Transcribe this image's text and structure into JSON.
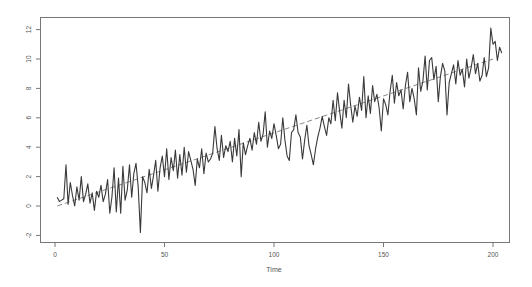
{
  "chart_data": {
    "type": "line",
    "title": "",
    "xlabel": "Time",
    "ylabel": "",
    "xlim": [
      -8,
      209
    ],
    "ylim": [
      -2.4,
      12.8
    ],
    "x_ticks": [
      0,
      50,
      100,
      150,
      200
    ],
    "y_ticks": [
      -2,
      0,
      2,
      4,
      6,
      8,
      10,
      12
    ],
    "grid": false,
    "legend": null,
    "series": [
      {
        "name": "series",
        "style": "solid",
        "color": "#3a3a3a",
        "x_start": 1,
        "values": [
          0.6,
          0.3,
          0.4,
          0.5,
          2.8,
          0.1,
          1.6,
          0.7,
          0.0,
          1.3,
          0.4,
          2.0,
          0.3,
          0.8,
          1.5,
          0.2,
          0.9,
          -0.3,
          1.0,
          0.6,
          1.4,
          0.3,
          0.8,
          1.8,
          -0.5,
          0.6,
          2.6,
          -0.4,
          1.9,
          -0.5,
          2.7,
          0.4,
          1.1,
          2.8,
          0.6,
          2.2,
          2.9,
          1.3,
          -1.8,
          2.0,
          1.6,
          0.9,
          2.5,
          1.2,
          2.1,
          3.1,
          1.0,
          2.6,
          3.4,
          2.0,
          3.9,
          1.8,
          3.3,
          2.4,
          3.8,
          1.9,
          3.5,
          2.1,
          4.0,
          2.3,
          3.7,
          3.1,
          2.5,
          1.4,
          3.2,
          2.6,
          3.9,
          2.2,
          3.6,
          3.0,
          3.2,
          3.6,
          5.4,
          3.9,
          3.1,
          4.8,
          3.3,
          4.1,
          3.7,
          4.4,
          3.0,
          4.6,
          3.4,
          5.2,
          2.0,
          4.3,
          3.5,
          4.1,
          4.6,
          3.8,
          5.0,
          4.2,
          5.7,
          4.4,
          4.9,
          6.4,
          4.0,
          5.1,
          4.6,
          5.6,
          4.8,
          3.9,
          4.2,
          6.0,
          4.5,
          3.4,
          3.1,
          5.0,
          5.2,
          6.2,
          5.0,
          4.7,
          3.2,
          4.5,
          5.5,
          4.1,
          3.5,
          2.8,
          3.9,
          4.7,
          5.3,
          6.1,
          5.4,
          4.8,
          6.0,
          5.6,
          7.2,
          5.8,
          7.7,
          6.4,
          5.3,
          7.2,
          6.0,
          8.3,
          6.9,
          5.7,
          6.8,
          6.1,
          7.4,
          6.5,
          8.8,
          6.0,
          7.5,
          6.3,
          8.2,
          7.1,
          7.6,
          6.7,
          5.1,
          7.3,
          6.9,
          6.2,
          7.8,
          8.9,
          7.0,
          8.4,
          7.5,
          7.9,
          6.6,
          8.2,
          9.1,
          7.1,
          8.0,
          7.3,
          6.2,
          9.4,
          7.8,
          8.5,
          10.2,
          7.9,
          9.9,
          10.1,
          8.6,
          9.5,
          7.1,
          8.8,
          9.7,
          9.2,
          6.2,
          8.4,
          9.0,
          9.6,
          8.3,
          9.9,
          8.9,
          9.3,
          8.1,
          10.0,
          8.7,
          9.4,
          10.3,
          9.0,
          9.7,
          8.5,
          8.9,
          10.1,
          8.8,
          9.4,
          12.1,
          11.0,
          11.2,
          9.9,
          10.8,
          10.4
        ],
        "last_t": 200
      },
      {
        "name": "trend",
        "style": "dashed",
        "color": "#888888",
        "x": [
          1,
          200
        ],
        "values": [
          0.0,
          10.0
        ]
      }
    ]
  }
}
